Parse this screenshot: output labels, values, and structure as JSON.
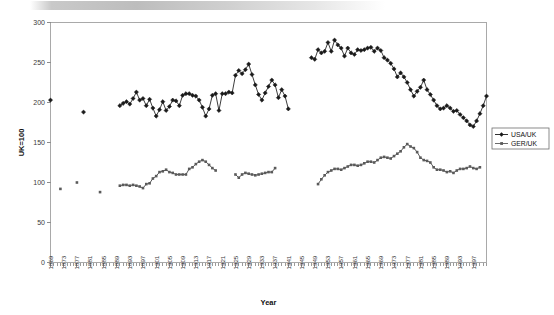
{
  "chart_data": {
    "type": "line",
    "title": "",
    "xlabel": "Year",
    "ylabel": "UK=100",
    "xlim": [
      1869,
      1999
    ],
    "ylim": [
      0,
      300
    ],
    "ytick_step": 50,
    "yticks": [
      0,
      50,
      100,
      150,
      200,
      250,
      300
    ],
    "xtick_step": 4,
    "xticks": [
      1869,
      1873,
      1877,
      1881,
      1885,
      1889,
      1893,
      1897,
      1901,
      1905,
      1909,
      1913,
      1917,
      1921,
      1925,
      1929,
      1933,
      1937,
      1941,
      1945,
      1949,
      1953,
      1957,
      1961,
      1965,
      1969,
      1973,
      1977,
      1981,
      1985,
      1989,
      1993,
      1997
    ],
    "grid": false,
    "legend_position": "right-middle",
    "series": [
      {
        "name": "USA/UK",
        "color": "#1a1a1a",
        "marker": "diamond",
        "points": [
          [
            1869,
            203
          ],
          [
            1879,
            188
          ],
          [
            1890,
            196
          ],
          [
            1891,
            199
          ],
          [
            1892,
            201
          ],
          [
            1893,
            198
          ],
          [
            1894,
            205
          ],
          [
            1895,
            213
          ],
          [
            1896,
            203
          ],
          [
            1897,
            205
          ],
          [
            1898,
            196
          ],
          [
            1899,
            204
          ],
          [
            1900,
            193
          ],
          [
            1901,
            183
          ],
          [
            1902,
            191
          ],
          [
            1903,
            201
          ],
          [
            1904,
            190
          ],
          [
            1905,
            195
          ],
          [
            1906,
            203
          ],
          [
            1907,
            202
          ],
          [
            1908,
            196
          ],
          [
            1909,
            209
          ],
          [
            1910,
            211
          ],
          [
            1911,
            211
          ],
          [
            1912,
            209
          ],
          [
            1913,
            208
          ],
          [
            1914,
            203
          ],
          [
            1915,
            194
          ],
          [
            1916,
            183
          ],
          [
            1917,
            192
          ],
          [
            1918,
            209
          ],
          [
            1919,
            211
          ],
          [
            1920,
            190
          ],
          [
            1921,
            211
          ],
          [
            1922,
            211
          ],
          [
            1923,
            213
          ],
          [
            1924,
            212
          ],
          [
            1925,
            234
          ],
          [
            1926,
            240
          ],
          [
            1927,
            236
          ],
          [
            1928,
            241
          ],
          [
            1929,
            248
          ],
          [
            1930,
            235
          ],
          [
            1931,
            222
          ],
          [
            1932,
            210
          ],
          [
            1933,
            203
          ],
          [
            1934,
            212
          ],
          [
            1935,
            220
          ],
          [
            1936,
            228
          ],
          [
            1937,
            222
          ],
          [
            1938,
            206
          ],
          [
            1939,
            216
          ],
          [
            1940,
            208
          ],
          [
            1941,
            192
          ],
          [
            1948,
            256
          ],
          [
            1949,
            254
          ],
          [
            1950,
            266
          ],
          [
            1951,
            262
          ],
          [
            1952,
            264
          ],
          [
            1953,
            275
          ],
          [
            1954,
            264
          ],
          [
            1955,
            278
          ],
          [
            1956,
            272
          ],
          [
            1957,
            268
          ],
          [
            1958,
            258
          ],
          [
            1959,
            268
          ],
          [
            1960,
            262
          ],
          [
            1961,
            260
          ],
          [
            1962,
            266
          ],
          [
            1963,
            265
          ],
          [
            1964,
            266
          ],
          [
            1965,
            268
          ],
          [
            1966,
            269
          ],
          [
            1967,
            264
          ],
          [
            1968,
            268
          ],
          [
            1969,
            265
          ],
          [
            1970,
            256
          ],
          [
            1971,
            253
          ],
          [
            1972,
            249
          ],
          [
            1973,
            242
          ],
          [
            1974,
            232
          ],
          [
            1975,
            237
          ],
          [
            1976,
            232
          ],
          [
            1977,
            225
          ],
          [
            1978,
            216
          ],
          [
            1979,
            208
          ],
          [
            1980,
            214
          ],
          [
            1981,
            219
          ],
          [
            1982,
            228
          ],
          [
            1983,
            216
          ],
          [
            1984,
            210
          ],
          [
            1985,
            203
          ],
          [
            1986,
            196
          ],
          [
            1987,
            192
          ],
          [
            1988,
            193
          ],
          [
            1989,
            196
          ],
          [
            1990,
            193
          ],
          [
            1991,
            189
          ],
          [
            1992,
            190
          ],
          [
            1993,
            185
          ],
          [
            1994,
            181
          ],
          [
            1995,
            177
          ],
          [
            1996,
            172
          ],
          [
            1997,
            170
          ],
          [
            1998,
            177
          ],
          [
            1999,
            186
          ],
          [
            2000,
            196
          ],
          [
            2001,
            208
          ]
        ]
      },
      {
        "name": "GER/UK",
        "color": "#5a5a5a",
        "marker": "square",
        "points": [
          [
            1872,
            92
          ],
          [
            1877,
            100
          ],
          [
            1884,
            88
          ],
          [
            1890,
            96
          ],
          [
            1891,
            97
          ],
          [
            1892,
            97
          ],
          [
            1893,
            96
          ],
          [
            1894,
            97
          ],
          [
            1895,
            96
          ],
          [
            1896,
            95
          ],
          [
            1897,
            93
          ],
          [
            1898,
            98
          ],
          [
            1899,
            99
          ],
          [
            1900,
            105
          ],
          [
            1901,
            108
          ],
          [
            1902,
            113
          ],
          [
            1903,
            114
          ],
          [
            1904,
            116
          ],
          [
            1905,
            113
          ],
          [
            1906,
            112
          ],
          [
            1907,
            110
          ],
          [
            1908,
            110
          ],
          [
            1909,
            110
          ],
          [
            1910,
            110
          ],
          [
            1911,
            117
          ],
          [
            1912,
            119
          ],
          [
            1913,
            123
          ],
          [
            1914,
            126
          ],
          [
            1915,
            128
          ],
          [
            1916,
            126
          ],
          [
            1917,
            122
          ],
          [
            1918,
            118
          ],
          [
            1919,
            115
          ],
          [
            1925,
            110
          ],
          [
            1926,
            106
          ],
          [
            1927,
            110
          ],
          [
            1928,
            112
          ],
          [
            1929,
            111
          ],
          [
            1930,
            110
          ],
          [
            1931,
            109
          ],
          [
            1932,
            110
          ],
          [
            1933,
            111
          ],
          [
            1934,
            112
          ],
          [
            1935,
            113
          ],
          [
            1936,
            113
          ],
          [
            1937,
            118
          ],
          [
            1950,
            98
          ],
          [
            1951,
            104
          ],
          [
            1952,
            109
          ],
          [
            1953,
            113
          ],
          [
            1954,
            115
          ],
          [
            1955,
            117
          ],
          [
            1956,
            117
          ],
          [
            1957,
            116
          ],
          [
            1958,
            118
          ],
          [
            1959,
            120
          ],
          [
            1960,
            122
          ],
          [
            1961,
            122
          ],
          [
            1962,
            121
          ],
          [
            1963,
            122
          ],
          [
            1964,
            124
          ],
          [
            1965,
            126
          ],
          [
            1966,
            126
          ],
          [
            1967,
            125
          ],
          [
            1968,
            128
          ],
          [
            1969,
            131
          ],
          [
            1970,
            132
          ],
          [
            1971,
            131
          ],
          [
            1972,
            130
          ],
          [
            1973,
            133
          ],
          [
            1974,
            136
          ],
          [
            1975,
            139
          ],
          [
            1976,
            144
          ],
          [
            1977,
            148
          ],
          [
            1978,
            145
          ],
          [
            1979,
            143
          ],
          [
            1980,
            138
          ],
          [
            1981,
            131
          ],
          [
            1982,
            128
          ],
          [
            1983,
            127
          ],
          [
            1984,
            125
          ],
          [
            1985,
            119
          ],
          [
            1986,
            116
          ],
          [
            1987,
            116
          ],
          [
            1988,
            115
          ],
          [
            1989,
            113
          ],
          [
            1990,
            114
          ],
          [
            1991,
            112
          ],
          [
            1992,
            115
          ],
          [
            1993,
            117
          ],
          [
            1994,
            117
          ],
          [
            1995,
            118
          ],
          [
            1996,
            120
          ],
          [
            1997,
            118
          ],
          [
            1998,
            117
          ],
          [
            1999,
            119
          ]
        ]
      }
    ]
  },
  "legend": {
    "items": [
      {
        "label": "USA/UK"
      },
      {
        "label": "GER/UK"
      }
    ]
  },
  "axes": {
    "x_title": "Year",
    "y_title": "UK=100"
  }
}
